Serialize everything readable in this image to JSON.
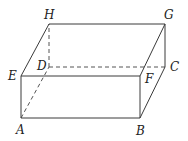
{
  "figure": {
    "type": "rectangular-box",
    "labels": {
      "A": "A",
      "B": "B",
      "C": "C",
      "D": "D",
      "E": "E",
      "F": "F",
      "G": "G",
      "H": "H"
    },
    "vertices": {
      "A": [
        21,
        118
      ],
      "B": [
        140,
        118
      ],
      "C": [
        165,
        67
      ],
      "D": [
        49,
        67
      ],
      "E": [
        21,
        76
      ],
      "F": [
        140,
        76
      ],
      "G": [
        165,
        24
      ],
      "H": [
        49,
        24
      ]
    },
    "solid_edges": [
      "AB",
      "BF",
      "FE",
      "EA",
      "EH",
      "HG",
      "GF",
      "GC",
      "CB"
    ],
    "dashed_edges": [
      "AD",
      "DC",
      "DH"
    ],
    "colors": {
      "edge": "#3a3a3a",
      "label": "#222222",
      "background": "#ffffff"
    }
  }
}
